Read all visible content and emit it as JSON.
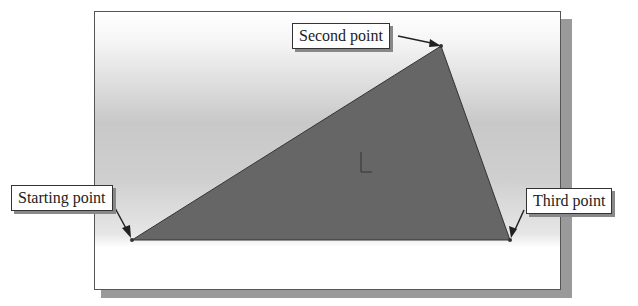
{
  "callouts": {
    "second_point": "Second point",
    "starting_point": "Starting point",
    "third_point": "Third point"
  },
  "triangle": {
    "fill": "#666666",
    "points": {
      "start": [
        132,
        240
      ],
      "second": [
        441,
        46
      ],
      "third": [
        510,
        240
      ]
    }
  },
  "viewport": {
    "background_top": "#ffffff",
    "background_mid": "#c8c8c8"
  }
}
